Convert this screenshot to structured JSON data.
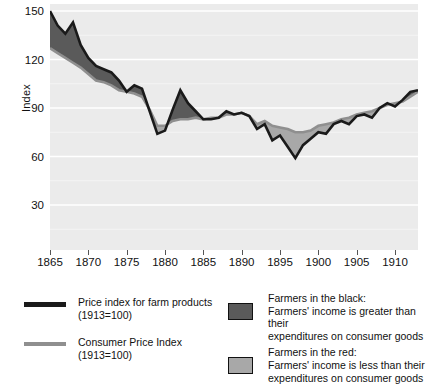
{
  "chart_data": {
    "type": "area",
    "title": "",
    "subtitle": "",
    "xlabel": "",
    "ylabel": "Index",
    "xlim": [
      1865,
      1913
    ],
    "ylim": [
      0,
      155
    ],
    "yticks": [
      30,
      60,
      90,
      120,
      150
    ],
    "xticks": [
      1865,
      1870,
      1875,
      1880,
      1885,
      1890,
      1895,
      1900,
      1905,
      1910
    ],
    "grid": "horizontal-white-on-grey",
    "legend_position": "below-plot",
    "colors": {
      "farm_line": "#1a1a1a",
      "cpi_line": "#8f8f8f",
      "fill_black": "#5a5a5a",
      "fill_red": "#a8a8a8",
      "plot_background": "#ebebeb",
      "gridline": "#ffffff"
    },
    "x": [
      1865,
      1866,
      1867,
      1868,
      1869,
      1870,
      1871,
      1872,
      1873,
      1874,
      1875,
      1876,
      1877,
      1878,
      1879,
      1880,
      1881,
      1882,
      1883,
      1884,
      1885,
      1886,
      1887,
      1888,
      1889,
      1890,
      1891,
      1892,
      1893,
      1894,
      1895,
      1896,
      1897,
      1898,
      1899,
      1900,
      1901,
      1902,
      1903,
      1904,
      1905,
      1906,
      1907,
      1908,
      1909,
      1910,
      1911,
      1912,
      1913
    ],
    "series": [
      {
        "name": "Price index for farm products (1913=100)",
        "type": "line",
        "color": "#1a1a1a",
        "values": [
          150,
          141,
          136,
          143,
          129,
          121,
          116,
          114,
          112,
          107,
          100,
          104,
          102,
          88,
          74,
          76,
          89,
          101,
          93,
          88,
          83,
          83,
          84,
          88,
          86,
          87,
          85,
          77,
          80,
          70,
          73,
          66,
          59,
          67,
          71,
          75,
          74,
          80,
          82,
          80,
          85,
          86,
          84,
          90,
          93,
          91,
          95,
          100,
          101
        ]
      },
      {
        "name": "Consumer Price Index (1913=100)",
        "type": "line",
        "color": "#8f8f8f",
        "values": [
          127,
          124,
          121,
          118,
          115,
          111,
          107,
          106,
          104,
          101,
          100,
          99,
          97,
          89,
          79,
          79,
          82,
          83,
          83,
          84,
          83,
          84,
          84,
          86,
          86,
          87,
          85,
          80,
          82,
          79,
          78,
          77,
          75,
          75,
          76,
          79,
          80,
          81,
          83,
          84,
          86,
          87,
          88,
          90,
          92,
          93,
          94,
          97,
          100
        ]
      }
    ],
    "annotations": [
      "Shaded region between the two lines is dark when farm prices exceed consumer prices, light when consumer prices exceed farm prices."
    ]
  },
  "axis": {
    "ylabel": "Index",
    "yticks": [
      "150",
      "120",
      "90",
      "60",
      "30"
    ],
    "xticks": [
      "1865",
      "1870",
      "1875",
      "1880",
      "1885",
      "1890",
      "1895",
      "1900",
      "1905",
      "1910"
    ]
  },
  "legend": {
    "left": [
      {
        "swatch": "thick-black-line",
        "line1": "Price index for farm products",
        "line2": "(1913=100)"
      },
      {
        "swatch": "grey-line",
        "line1": "Consumer Price Index",
        "line2": "(1913=100)"
      }
    ],
    "right": [
      {
        "swatch": "dark-grey-box",
        "swatch_color": "#5a5a5a",
        "line1": "Farmers in the black:",
        "line2": "Farmers' income is greater than their",
        "line3": "expenditures on consumer goods"
      },
      {
        "swatch": "light-grey-box",
        "swatch_color": "#a8a8a8",
        "line1": "Farmers in the red:",
        "line2": "Farmers' income is less than their",
        "line3": "expenditures on consumer goods"
      }
    ]
  }
}
